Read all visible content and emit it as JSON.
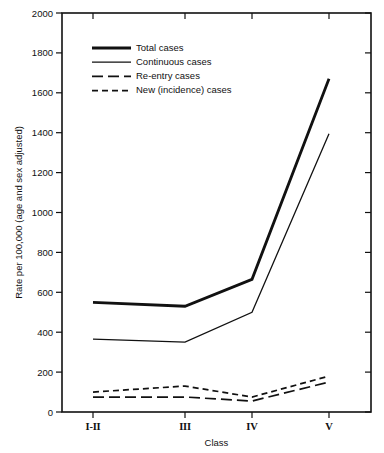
{
  "chart_data": {
    "type": "line",
    "title": "",
    "xlabel": "Class",
    "ylabel": "Rate per 100,000 (age and sex adjusted)",
    "categories": [
      "I-II",
      "III",
      "IV",
      "V"
    ],
    "ylim": [
      0,
      2000
    ],
    "ytick_labels": [
      "0",
      "200",
      "400",
      "600",
      "800",
      "1000",
      "1200",
      "1400",
      "1600",
      "1800",
      "2000"
    ],
    "ytick_values": [
      0,
      200,
      400,
      600,
      800,
      1000,
      1200,
      1400,
      1600,
      1800,
      2000
    ],
    "grid": false,
    "legend_position": "upper-left-inside",
    "series": [
      {
        "name": "Total cases",
        "style": "solid-thick",
        "values": [
          550,
          530,
          665,
          1670
        ]
      },
      {
        "name": "Continuous cases",
        "style": "solid-thin",
        "values": [
          365,
          350,
          500,
          1395
        ]
      },
      {
        "name": "Re-entry cases",
        "style": "long-dash",
        "values": [
          75,
          75,
          55,
          150
        ]
      },
      {
        "name": "New (incidence) cases",
        "style": "short-dash",
        "values": [
          100,
          130,
          75,
          180
        ]
      }
    ]
  },
  "colors": {
    "ink": "#111111",
    "background": "#ffffff"
  }
}
